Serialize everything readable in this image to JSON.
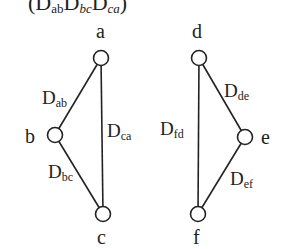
{
  "header": {
    "text_prefix": "(D",
    "sub1": "ab",
    "d2": "D",
    "sub2": "bc",
    "d3": "D",
    "sub3": "ca",
    "suffix": ")"
  },
  "graphs": [
    {
      "nodes": [
        {
          "id": "a",
          "label": "a",
          "x": 101,
          "y": 58
        },
        {
          "id": "b",
          "label": "b",
          "x": 55,
          "y": 135
        },
        {
          "id": "c",
          "label": "c",
          "x": 103,
          "y": 214
        }
      ],
      "edges": [
        {
          "from": "a",
          "to": "b",
          "label_main": "D",
          "label_sub": "ab"
        },
        {
          "from": "b",
          "to": "c",
          "label_main": "D",
          "label_sub": "bc"
        },
        {
          "from": "c",
          "to": "a",
          "label_main": "D",
          "label_sub": "ca"
        }
      ]
    },
    {
      "nodes": [
        {
          "id": "d",
          "label": "d",
          "x": 199,
          "y": 58
        },
        {
          "id": "e",
          "label": "e",
          "x": 245,
          "y": 137
        },
        {
          "id": "f",
          "label": "f",
          "x": 198,
          "y": 214
        }
      ],
      "edges": [
        {
          "from": "d",
          "to": "e",
          "label_main": "D",
          "label_sub": "de"
        },
        {
          "from": "e",
          "to": "f",
          "label_main": "D",
          "label_sub": "ef"
        },
        {
          "from": "f",
          "to": "d",
          "label_main": "D",
          "label_sub": "fd"
        }
      ]
    }
  ],
  "colors": {
    "stroke": "#222222",
    "background": "#ffffff"
  }
}
